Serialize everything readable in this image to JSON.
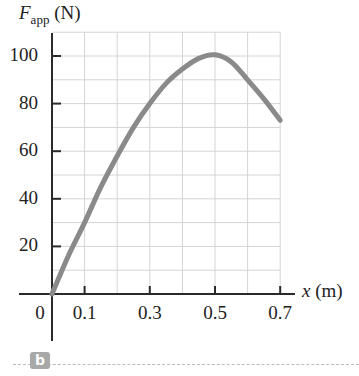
{
  "chart_data": {
    "type": "line",
    "title": "",
    "panel_label": "b",
    "ylabel": {
      "symbol": "F",
      "subscript": "app",
      "unit": "(N)"
    },
    "xlabel": {
      "symbol": "x",
      "unit": "(m)"
    },
    "xlim": [
      0,
      0.7
    ],
    "ylim": [
      0,
      110
    ],
    "grid": true,
    "x_ticks": [
      0,
      0.1,
      0.3,
      0.5,
      0.7
    ],
    "x_tick_labels": [
      "0",
      "0.1",
      "0.3",
      "0.5",
      "0.7"
    ],
    "y_ticks": [
      20,
      40,
      60,
      80,
      100
    ],
    "y_tick_labels": [
      "20",
      "40",
      "60",
      "80",
      "100"
    ],
    "x_gridlines": [
      0.1,
      0.2,
      0.3,
      0.4,
      0.5,
      0.6,
      0.7
    ],
    "y_gridlines": [
      10,
      20,
      30,
      40,
      50,
      60,
      70,
      80,
      90,
      100,
      110
    ],
    "series": [
      {
        "name": "F_app vs x",
        "color": "#8a8a8a",
        "x": [
          0,
          0.05,
          0.1,
          0.15,
          0.2,
          0.25,
          0.3,
          0.35,
          0.4,
          0.45,
          0.5,
          0.55,
          0.6,
          0.65,
          0.7
        ],
        "y": [
          0,
          16,
          30,
          45,
          58,
          70,
          80,
          88.5,
          94.5,
          99,
          100.5,
          97.5,
          90,
          82,
          73
        ]
      }
    ]
  },
  "labels": {
    "y_symbol": "F",
    "y_sub": "app",
    "y_unit": " (N)",
    "x_symbol": "x",
    "x_unit": " (m)",
    "panel": "b"
  }
}
